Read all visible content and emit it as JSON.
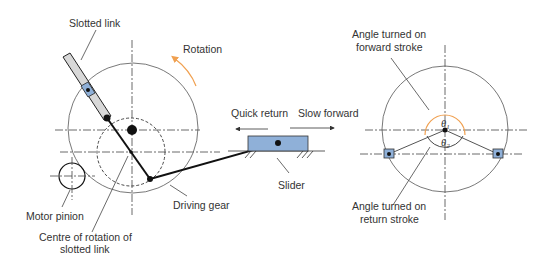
{
  "diagram": {
    "colors": {
      "rotation_arrow": "#f0a050",
      "forward_angle_arc": "#f0a050",
      "slider_fill": "#8fb0d8",
      "block_fill": "#8fb0d8",
      "lines": "#111111"
    },
    "left_labels": {
      "slotted_link": "Slotted link",
      "rotation": "Rotation",
      "quick_return": "Quick return",
      "slow_forward": "Slow forward",
      "slider": "Slider",
      "driving_gear": "Driving gear",
      "motor_pinion": "Motor pinion",
      "centre_line1": "Centre of rotation of",
      "centre_line2": "slotted link"
    },
    "right_labels": {
      "forward_line1": "Angle turned on",
      "forward_line2": "forward stroke",
      "return_line1": "Angle turned on",
      "return_line2": "return stroke",
      "theta1": "θ",
      "theta1_sub": "1",
      "theta2": "θ",
      "theta2_sub": "2"
    }
  }
}
